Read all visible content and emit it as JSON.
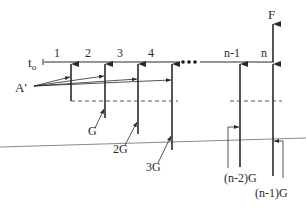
{
  "diagram": {
    "type": "cash-flow-gradient-series",
    "origin_label": "t",
    "origin_subscript": "o",
    "period_labels": [
      "1",
      "2",
      "3",
      "4",
      "n-1",
      "n"
    ],
    "ellipsis": "•••",
    "future_value_label": "F",
    "annuity_label": "A'",
    "gradient_labels": [
      "G",
      "2G",
      "3G",
      "(n-2)G",
      "(n-1)G"
    ],
    "colors": {
      "line": "#2a2a2a",
      "dashed": "#555555",
      "ground_line": "#8a8a8a",
      "background": "#ffffff"
    }
  }
}
